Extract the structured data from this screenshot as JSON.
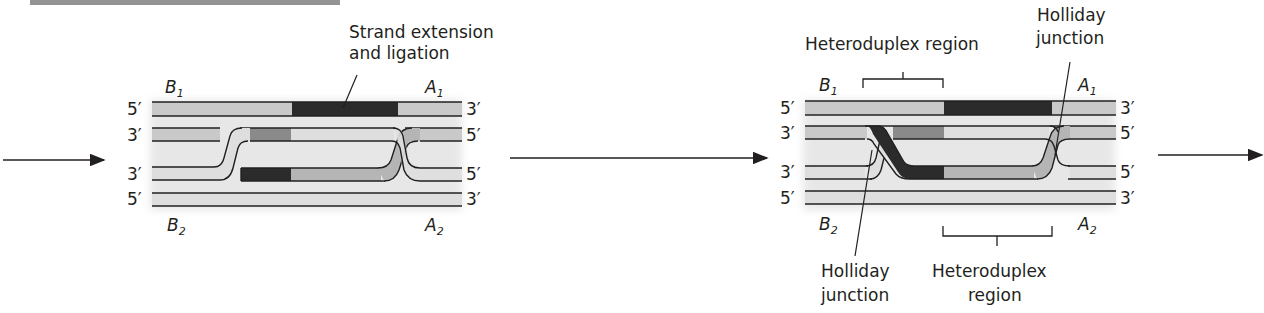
{
  "header": {
    "cut_off_text": "a. Second end capture and strand extension..."
  },
  "arrows": [
    {
      "id": "arrow-in",
      "direction": "right"
    },
    {
      "id": "arrow-middle",
      "direction": "right"
    },
    {
      "id": "arrow-out",
      "direction": "right"
    }
  ],
  "panel1": {
    "callout": {
      "line1": "Strand extension",
      "line2": "and ligation"
    },
    "labels": {
      "top_left": "B",
      "top_left_sub": "1",
      "top_right": "A",
      "top_right_sub": "1",
      "bottom_left": "B",
      "bottom_left_sub": "2",
      "bottom_right": "A",
      "bottom_right_sub": "2"
    },
    "ends": {
      "row1_left": "5′",
      "row1_right": "3′",
      "row2_left": "3′",
      "row2_right": "5′",
      "row3_left": "3′",
      "row3_right": "5′",
      "row4_left": "5′",
      "row4_right": "3′"
    }
  },
  "panel2": {
    "callouts": {
      "heteroduplex_top": "Heteroduplex region",
      "holliday_top_line1": "Holliday",
      "holliday_top_line2": "junction",
      "holliday_bottom_line1": "Holliday",
      "holliday_bottom_line2": "junction",
      "heteroduplex_bottom_line1": "Heteroduplex",
      "heteroduplex_bottom_line2": "region"
    },
    "labels": {
      "top_left": "B",
      "top_left_sub": "1",
      "top_right": "A",
      "top_right_sub": "1",
      "bottom_left": "B",
      "bottom_left_sub": "2",
      "bottom_right": "A",
      "bottom_right_sub": "2"
    },
    "ends": {
      "row1_left": "5′",
      "row1_right": "3′",
      "row2_left": "3′",
      "row2_right": "5′",
      "row3_left": "3′",
      "row3_right": "5′",
      "row4_left": "5′",
      "row4_right": "3′"
    }
  },
  "colors": {
    "light_strand": "#c9c9c9",
    "lighter_strand": "#dedede",
    "mid_strand": "#8a8a8a",
    "dark_strand": "#2b2b2b",
    "outline": "#231f20"
  }
}
